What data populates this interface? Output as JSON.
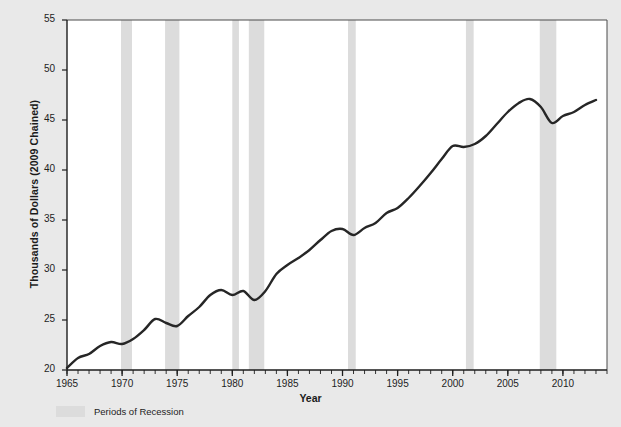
{
  "chart_data": {
    "type": "line",
    "title": "",
    "xlabel": "Year",
    "ylabel": "Thousands of Dollars (2009 Chained)",
    "xlim": [
      1965,
      2014
    ],
    "ylim": [
      20,
      55
    ],
    "grid": false,
    "legend_position": "below-axes-left",
    "y_ticks": [
      20,
      25,
      30,
      35,
      40,
      45,
      50,
      55
    ],
    "x_ticks": [
      1965,
      1970,
      1975,
      1980,
      1985,
      1990,
      1995,
      2000,
      2005,
      2010
    ],
    "x_minor_tick_interval": 1,
    "series": [
      {
        "name": "Real GDP per Capita",
        "color": "#262626",
        "x": [
          1965,
          1966,
          1967,
          1968,
          1969,
          1970,
          1971,
          1972,
          1973,
          1974,
          1975,
          1976,
          1977,
          1978,
          1979,
          1980,
          1981,
          1982,
          1983,
          1984,
          1985,
          1986,
          1987,
          1988,
          1989,
          1990,
          1991,
          1992,
          1993,
          1994,
          1995,
          1996,
          1997,
          1998,
          1999,
          2000,
          2001,
          2002,
          2003,
          2004,
          2005,
          2006,
          2007,
          2008,
          2009,
          2010,
          2011,
          2012,
          2013
        ],
        "values": [
          20.2,
          21.2,
          21.6,
          22.4,
          22.8,
          22.6,
          23.1,
          24.0,
          25.1,
          24.7,
          24.4,
          25.4,
          26.3,
          27.5,
          28.0,
          27.5,
          27.9,
          27.0,
          27.9,
          29.6,
          30.5,
          31.2,
          32.0,
          33.0,
          33.9,
          34.1,
          33.5,
          34.2,
          34.7,
          35.7,
          36.2,
          37.2,
          38.4,
          39.7,
          41.1,
          42.4,
          42.3,
          42.6,
          43.4,
          44.6,
          45.8,
          46.7,
          47.1,
          46.3,
          44.7,
          45.4,
          45.8,
          46.5,
          47.0
        ]
      }
    ],
    "shaded_regions": {
      "label": "Periods of Recession",
      "color": "#dcdcdc",
      "spans": [
        [
          1969.9,
          1970.9
        ],
        [
          1973.9,
          1975.2
        ],
        [
          1980.0,
          1980.6
        ],
        [
          1981.5,
          1982.9
        ],
        [
          1990.5,
          1991.2
        ],
        [
          2001.2,
          2001.9
        ],
        [
          2007.9,
          2009.4
        ]
      ]
    }
  },
  "axis": {
    "y_label": "Thousands of Dollars (2009 Chained)",
    "x_label": "Year",
    "y_tick_labels": [
      "55",
      "50",
      "45",
      "40",
      "35",
      "30",
      "25",
      "20"
    ],
    "x_tick_labels": [
      "1965",
      "1970",
      "1975",
      "1980",
      "1985",
      "1990",
      "1995",
      "2000",
      "2005",
      "2010"
    ]
  },
  "legend": {
    "recession_label": "Periods of Recession"
  }
}
